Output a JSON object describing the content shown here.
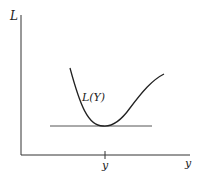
{
  "diagram": {
    "y_axis_label": "L",
    "x_axis_label": "y",
    "x_tick_label": "y",
    "curve_label": "L(Y)",
    "colors": {
      "axis": "#333333",
      "curve": "#222222",
      "line": "#555555"
    }
  }
}
